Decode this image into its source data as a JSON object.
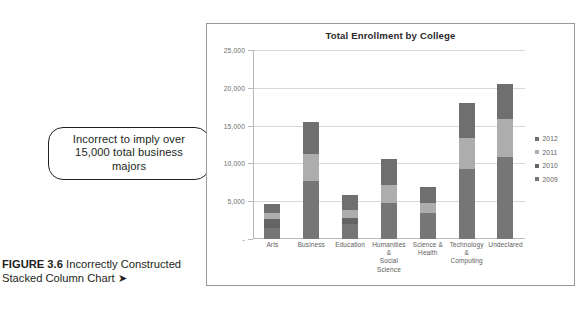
{
  "page": {
    "top_cut_text": "page running header partially cropped"
  },
  "caption": {
    "figure_number": "FIGURE 3.6",
    "text": " Incorrectly Constructed Stacked Column Chart ",
    "arrow": "➤"
  },
  "callout": {
    "line1": "Incorrect to imply over",
    "line2": "15,000 total business majors"
  },
  "chart_data": {
    "type": "bar",
    "subtype": "stacked-column",
    "title": "Total Enrollment by College",
    "xlabel": "",
    "ylabel": "",
    "ylim": [
      0,
      25000
    ],
    "grid": true,
    "legend_position": "right",
    "ytick_labels": [
      "-",
      "5,000",
      "10,000",
      "15,000",
      "20,000",
      "25,000"
    ],
    "ytick_values": [
      0,
      5000,
      10000,
      15000,
      20000,
      25000
    ],
    "categories": [
      "Arts",
      "Business",
      "Education",
      "Humanities & Social Science",
      "Science & Health",
      "Technology & Computing",
      "Undeclared"
    ],
    "category_lines": [
      [
        "Arts"
      ],
      [
        "Business"
      ],
      [
        "Education"
      ],
      [
        "Humanities &",
        "Social Science"
      ],
      [
        "Science &",
        "Health"
      ],
      [
        "Technology &",
        "Computing"
      ],
      [
        "Undeclared"
      ]
    ],
    "series": [
      {
        "name": "2009",
        "color": "#767676",
        "values": [
          1500,
          7700,
          2000,
          4700,
          3500,
          9200,
          10800
        ]
      },
      {
        "name": "2010",
        "color": "#646464",
        "values": [
          1100,
          0,
          800,
          0,
          0,
          0,
          0
        ]
      },
      {
        "name": "2011",
        "color": "#adadad",
        "values": [
          900,
          3500,
          1100,
          2400,
          1200,
          4100,
          5100
        ]
      },
      {
        "name": "2012",
        "color": "#6f6f6f",
        "values": [
          1200,
          4300,
          1900,
          3500,
          2200,
          4700,
          4600
        ]
      }
    ],
    "series_legend_order": [
      "2012",
      "2011",
      "2010",
      "2009"
    ],
    "totals": [
      4700,
      15500,
      5800,
      10600,
      6900,
      18000,
      20500
    ]
  },
  "colors": {
    "frame": "#9a9a9a",
    "gridline": "#d9d9d9",
    "axis": "#b8b8b8",
    "text": "#231f20",
    "tick_text": "#5d5d5d"
  }
}
